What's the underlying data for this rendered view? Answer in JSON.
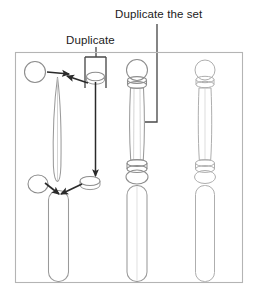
{
  "figure": {
    "kind": "technical-illustration",
    "frame": {
      "x": 15,
      "y": 52,
      "width": 228,
      "height": 231,
      "stroke": "#b4b4b4"
    }
  },
  "labels": {
    "duplicate": "Duplicate",
    "duplicate_the_set": "Duplicate the set"
  },
  "callouts": [
    {
      "name": "duplicate-callout",
      "text_ref": "labels.duplicate",
      "text_x": 66,
      "text_y": 44
    },
    {
      "name": "duplicate-the-set-callout",
      "text_ref": "labels.duplicate_the_set",
      "text_x": 115,
      "text_y": 18
    }
  ],
  "colors": {
    "frame_stroke": "#b4b4b4",
    "part_stroke": "#8d8d8d",
    "part_stroke_light": "#aeaeae",
    "arrow": "#2a2a2a",
    "leader": "#4a4a4a",
    "text": "#1b1b1b",
    "background": "#ffffff"
  },
  "columns": [
    {
      "name": "exploded-parts-column",
      "center_x": 57,
      "role": "source parts being duplicated"
    },
    {
      "name": "assembled-spindle-column",
      "center_x": 137,
      "role": "assembled spindle"
    },
    {
      "name": "duplicated-spindle-column",
      "center_x": 205,
      "role": "duplicated spindle set"
    }
  ],
  "parts": [
    {
      "name": "ball-part",
      "shape": "circle",
      "cx": 35,
      "cy": 72,
      "r": 10
    },
    {
      "name": "shaft-part",
      "shape": "lens",
      "cx": 57,
      "cy": 125,
      "half_width": 4,
      "top_y": 78,
      "bottom_y": 180
    },
    {
      "name": "ring-disk-part-top",
      "shape": "ellipse",
      "cx": 96,
      "cy": 76,
      "rx": 9,
      "ry": 4
    },
    {
      "name": "ring-disk-part-bottom",
      "shape": "ellipse",
      "cx": 90,
      "cy": 182,
      "rx": 10,
      "ry": 5
    },
    {
      "name": "base-oval-part",
      "shape": "ellipse",
      "cx": 38,
      "cy": 184,
      "rx": 10,
      "ry": 9
    },
    {
      "name": "base-cylinder-part",
      "shape": "rounded-rect",
      "x": 48,
      "y": 190,
      "width": 20,
      "height": 92
    }
  ],
  "arrows": [
    {
      "name": "ball-to-shaft-arrow",
      "from": [
        46,
        72
      ],
      "to": [
        68,
        74
      ]
    },
    {
      "name": "disk-to-shaft-arrow",
      "from": [
        88,
        84
      ],
      "to": [
        67,
        77
      ]
    },
    {
      "name": "disk-duplicate-down-arrow",
      "from": [
        95,
        84
      ],
      "to": [
        95,
        176
      ]
    },
    {
      "name": "oval-to-cylinder-arrow",
      "from": [
        44,
        184
      ],
      "to": [
        58,
        194
      ]
    },
    {
      "name": "disk-to-cylinder-arrow",
      "from": [
        82,
        184
      ],
      "to": [
        60,
        194
      ]
    }
  ],
  "leaders": {
    "duplicate_bracket": {
      "name": "duplicate-bracket-leader",
      "stem_x": 96,
      "stem_top_y": 48,
      "bracket_top_y": 57,
      "bracket_left_x": 85,
      "bracket_right_x": 106,
      "bracket_bottom_y": 88
    },
    "duplicate_the_set": {
      "name": "duplicate-the-set-leader",
      "stem_x": 157,
      "stem_top_y": 24,
      "corner_y": 122,
      "end_x": 145
    }
  }
}
